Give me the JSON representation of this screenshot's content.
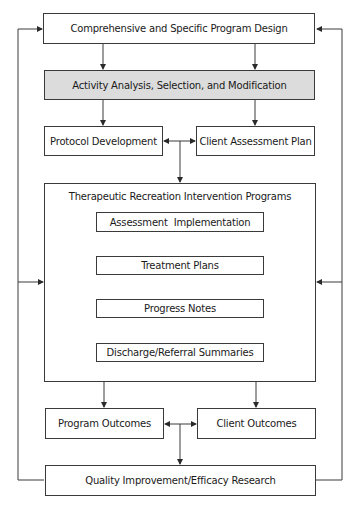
{
  "diagram": {
    "top": {
      "label": "Comprehensive and Specific Program Design"
    },
    "activity": {
      "label": "Activity Analysis, Selection, and Modification"
    },
    "protocol": {
      "label": "Protocol Development"
    },
    "client_assessment": {
      "label": "Client Assessment Plan"
    },
    "programs": {
      "title": "Therapeutic Recreation Intervention Programs",
      "steps": [
        {
          "label": "Assessment  Implementation"
        },
        {
          "label": "Treatment Plans"
        },
        {
          "label": "Progress Notes"
        },
        {
          "label": "Discharge/Referral Summaries"
        }
      ]
    },
    "program_outcomes": {
      "label": "Program Outcomes"
    },
    "client_outcomes": {
      "label": "Client Outcomes"
    },
    "quality": {
      "label": "Quality Improvement/Efficacy Research"
    }
  },
  "colors": {
    "line": "#3a3a3a",
    "highlight_fill": "#dcdcdc"
  }
}
